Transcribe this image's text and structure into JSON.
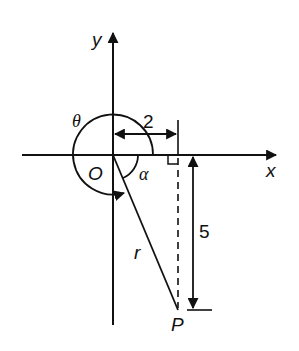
{
  "diagram": {
    "type": "polar-angle-construction",
    "axes": {
      "x_label": "x",
      "y_label": "y"
    },
    "labels": {
      "origin": "O",
      "point": "P",
      "radius": "r",
      "theta": "θ",
      "alpha": "α",
      "horizontal_distance": "2",
      "vertical_distance": "5"
    },
    "point_P": {
      "x": 2,
      "y": -5
    },
    "colors": {
      "stroke": "#111111",
      "background": "#ffffff"
    }
  }
}
